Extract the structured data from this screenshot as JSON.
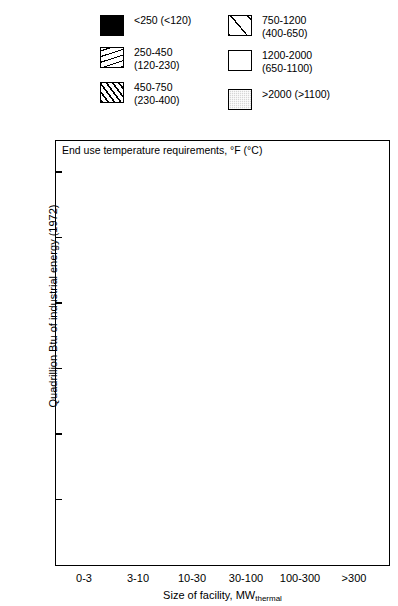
{
  "legend": {
    "columns": [
      {
        "items": [
          {
            "swatch": "pat-solid",
            "label": "<250 (<120)"
          },
          {
            "swatch": "pat-fine",
            "label": "250-450\n(120-230)"
          },
          {
            "swatch": "pat-dense",
            "label": "450-750\n(230-400)"
          }
        ]
      },
      {
        "items": [
          {
            "swatch": "pat-wide",
            "label": "750-1200\n(400-650)"
          },
          {
            "swatch": "pat-white",
            "label": "1200-2000\n(650-1100)"
          },
          {
            "swatch": "pat-gray",
            "label": ">2000 (>1100)"
          }
        ]
      }
    ]
  },
  "chart_data": {
    "type": "bar",
    "subtype": "stacked-bar",
    "title": "",
    "note": "End use temperature requirements, °F (°C)",
    "xlabel": "Size of facility, MWthermal",
    "xlabel_main": "Size of facility, MW",
    "xlabel_sub": "thermal",
    "ylabel": "Quadrillion Btu of industrial energy (1972)",
    "ylim": [
      0,
      3.2
    ],
    "yticks": [
      0.5,
      1.0,
      1.5,
      2.0,
      2.5,
      3.0
    ],
    "ytick_labels": [
      "0.5",
      "1.0",
      "1.5",
      "2.0",
      "2.5",
      "3.0"
    ],
    "grid": false,
    "legend_position": "above-plot",
    "categories": [
      "0-3",
      "3-10",
      "10-30",
      "30-100",
      "100-300",
      ">300"
    ],
    "series": [
      {
        "name": "<250 (<120)",
        "pattern": "pat-solid",
        "values": [
          0.21,
          0.29,
          0.0,
          0.0,
          0.0,
          0.0
        ]
      },
      {
        "name": "250-450 (120-230)",
        "pattern": "pat-fine",
        "values": [
          0.16,
          0.31,
          1.25,
          0.29,
          0.54,
          0.19
        ]
      },
      {
        "name": "450-750 (230-400)",
        "pattern": "pat-dense",
        "values": [
          0.0,
          0.0,
          0.17,
          0.27,
          0.0,
          0.0
        ]
      },
      {
        "name": "750-1200 (400-650)",
        "pattern": "pat-wide",
        "values": [
          0.0,
          0.0,
          0.46,
          1.52,
          0.0,
          0.0
        ]
      },
      {
        "name": "1200-2000 (650-1100)",
        "pattern": "pat-white",
        "values": [
          0.03,
          0.1,
          0.3,
          0.07,
          0.67,
          0.66
        ]
      },
      {
        "name": ">2000 (>1100)",
        "pattern": "pat-gray",
        "values": [
          0.22,
          0.24,
          0.25,
          0.8,
          1.1,
          0.62
        ]
      }
    ],
    "totals": [
      0.62,
      0.94,
      2.43,
      2.95,
      2.31,
      1.47
    ]
  }
}
